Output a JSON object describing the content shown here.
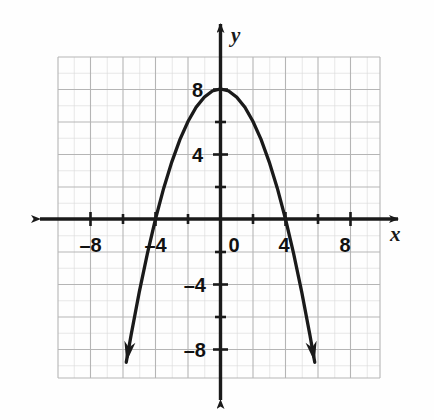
{
  "figure": {
    "name": "coordinate-plane-parabola",
    "background_color": "#fefefe",
    "ink_color": "#1a1a1a",
    "grid_color": "#b9b9b9",
    "grid_minor_color": "#d8d8d8"
  },
  "axes": {
    "x_axis_label": "x",
    "y_axis_label": "y",
    "origin_label": "0",
    "x_ticks": [
      {
        "value": -8,
        "label": "–8"
      },
      {
        "value": -4,
        "label": "–4"
      },
      {
        "value": 0,
        "label": "0"
      },
      {
        "value": 4,
        "label": "4"
      },
      {
        "value": 8,
        "label": "8"
      }
    ],
    "y_ticks": [
      {
        "value": 8,
        "label": "8"
      },
      {
        "value": 4,
        "label": "4"
      },
      {
        "value": -4,
        "label": "–4"
      },
      {
        "value": -8,
        "label": "–8"
      }
    ]
  },
  "chart_data": {
    "type": "line",
    "title": "",
    "xlabel": "x",
    "ylabel": "y",
    "xlim": [
      -10,
      10
    ],
    "ylim": [
      -10,
      10
    ],
    "grid": true,
    "legend": "none",
    "equation": "y = 8 - 0.5x^2",
    "vertex": [
      0,
      8
    ],
    "x_intercepts": [
      -4,
      4
    ],
    "y_intercept": 8,
    "opens": "down",
    "arrowheads": "both-ends-downward",
    "series": [
      {
        "name": "parabola",
        "x": [
          -5.8,
          -5.5,
          -5.0,
          -4.5,
          -4.0,
          -3.5,
          -3.0,
          -2.5,
          -2.0,
          -1.5,
          -1.0,
          -0.5,
          0.0,
          0.5,
          1.0,
          1.5,
          2.0,
          2.5,
          3.0,
          3.5,
          4.0,
          4.5,
          5.0,
          5.5,
          5.8
        ],
        "y": [
          -8.82,
          -7.13,
          -4.5,
          -2.13,
          0.0,
          1.88,
          3.5,
          4.88,
          6.0,
          6.88,
          7.5,
          7.88,
          8.0,
          7.88,
          7.5,
          6.88,
          6.0,
          4.88,
          3.5,
          1.88,
          0.0,
          -2.13,
          -4.5,
          -7.13,
          -8.82
        ]
      }
    ]
  }
}
